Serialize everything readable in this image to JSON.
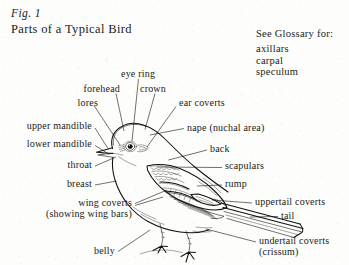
{
  "figure": {
    "number": "Fig. 1",
    "title": "Parts of a Typical Bird"
  },
  "glossary": {
    "heading": "See Glossary for:",
    "items": [
      "axillars",
      "carpal",
      "speculum"
    ]
  },
  "labels": {
    "eye_ring": "eye ring",
    "forehead": "forehead",
    "crown": "crown",
    "lores": "lores",
    "ear_coverts": "ear coverts",
    "upper_mandible": "upper mandible",
    "nape": "nape (nuchal area)",
    "lower_mandible": "lower mandible",
    "back": "back",
    "throat": "throat",
    "scapulars": "scapulars",
    "breast": "breast",
    "rump": "rump",
    "wing_coverts_1": "wing coverts",
    "wing_coverts_2": "(showing wing bars)",
    "uppertail_coverts": "uppertail coverts",
    "tail": "tail",
    "belly": "belly",
    "undertail_coverts_1": "undertail coverts",
    "undertail_coverts_2": "(crissum)"
  },
  "colors": {
    "ink": "#1a1a1a",
    "paper": "#fdfdfb",
    "line": "#111111"
  }
}
